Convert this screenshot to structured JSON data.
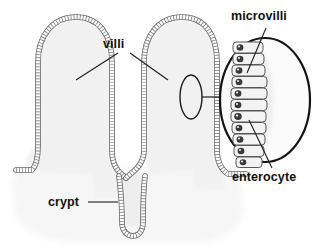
{
  "figure": {
    "type": "biological-diagram",
    "canvas": {
      "width": 315,
      "height": 249
    },
    "labels": {
      "villi": "villi",
      "crypt": "crypt",
      "microvilli": "microvilli",
      "enterocyte": "enterocyte"
    },
    "colors": {
      "background": "#ffffff",
      "villus_core": "#f1f1f1",
      "submucosa": "#f7f7f7",
      "epithelium_outline": "#5a5a5a",
      "epithelium_cell_fill": "#fbfbfb",
      "callout_outline": "#1a1a1a",
      "enterocyte_fill": "#f2f2f2",
      "enterocyte_outline": "#555555",
      "nucleus_fill": "#3a3a3a",
      "leader_line": "#222222",
      "label_text": "#111111"
    },
    "structures": [
      {
        "name": "villus-left",
        "kind": "villus",
        "description": "finger-like projection, left"
      },
      {
        "name": "villus-right",
        "kind": "villus",
        "description": "finger-like projection, right"
      },
      {
        "name": "crypt-center",
        "kind": "crypt",
        "description": "deep invagination between the two villi"
      },
      {
        "name": "submucosa",
        "kind": "tissue-base",
        "description": "pale tissue mound beneath the villi"
      }
    ],
    "callout": {
      "name": "enterocyte-magnification",
      "source_marker": "small oval on right villus epithelium",
      "enterocyte_count": 11,
      "enterocyte_feature": "dark nucleus at apical-left of each cell",
      "microvilli_feature": "brush border on apical surface of enterocytes"
    },
    "leaders": [
      {
        "name": "villi-leader-left",
        "from": "villi",
        "to": "villus-left core"
      },
      {
        "name": "villi-leader-right",
        "from": "villi",
        "to": "villus-right core"
      },
      {
        "name": "crypt-leader",
        "from": "crypt",
        "to": "crypt-center"
      },
      {
        "name": "microvilli-leader",
        "from": "microvilli",
        "to": "enterocyte apical border"
      },
      {
        "name": "enterocyte-leader",
        "from": "enterocyte",
        "to": "enterocyte cell body"
      },
      {
        "name": "callout-connector",
        "from": "source oval",
        "to": "magnification oval"
      }
    ]
  }
}
